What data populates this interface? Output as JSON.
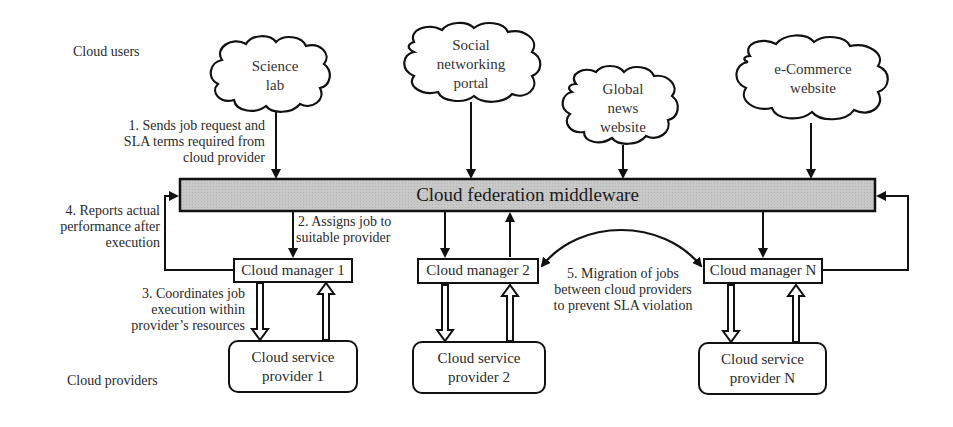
{
  "diagram": {
    "side_labels": {
      "users": "Cloud users",
      "providers": "Cloud providers"
    },
    "clouds": [
      {
        "id": "science-lab",
        "lines": [
          "Science",
          "lab"
        ]
      },
      {
        "id": "social-networking",
        "lines": [
          "Social",
          "networking",
          "portal"
        ]
      },
      {
        "id": "global-news",
        "lines": [
          "Global",
          "news",
          "website"
        ]
      },
      {
        "id": "ecommerce",
        "lines": [
          "e-Commerce",
          "website"
        ]
      }
    ],
    "middleware": {
      "title": "Cloud federation middleware",
      "fill": "#c8c8c8"
    },
    "managers": [
      {
        "label": "Cloud manager 1"
      },
      {
        "label": "Cloud manager 2"
      },
      {
        "label": "Cloud manager N"
      }
    ],
    "providers": [
      {
        "lines": [
          "Cloud service",
          "provider 1"
        ]
      },
      {
        "lines": [
          "Cloud service",
          "provider 2"
        ]
      },
      {
        "lines": [
          "Cloud service",
          "provider N"
        ]
      }
    ],
    "steps": {
      "step1": [
        "1. Sends job request and",
        "SLA terms required from",
        "cloud provider"
      ],
      "step2": [
        "2. Assigns job to",
        "suitable provider"
      ],
      "step3": [
        "3. Coordinates job",
        "execution within",
        "provider’s resources"
      ],
      "step4": [
        "4. Reports actual",
        "performance after",
        "execution"
      ],
      "step5": [
        "5. Migration of jobs",
        "between cloud providers",
        "to prevent SLA violation"
      ]
    }
  }
}
